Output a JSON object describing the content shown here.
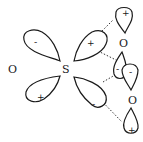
{
  "diagram": {
    "atoms": {
      "left_oxygen": "O",
      "sulfur": "S",
      "upper_right_oxygen": "O",
      "lower_right_oxygen": "O"
    },
    "d_orbital_signs": {
      "upper_left": "-",
      "lower_left": "+",
      "upper_right": "+",
      "lower_right": "-"
    },
    "p_orbital_signs": {
      "top": "+",
      "middle_left": "-",
      "middle_right": "-",
      "bottom": "+"
    },
    "colors": {
      "stroke": "#1a1a1a",
      "background": "#ffffff"
    }
  }
}
